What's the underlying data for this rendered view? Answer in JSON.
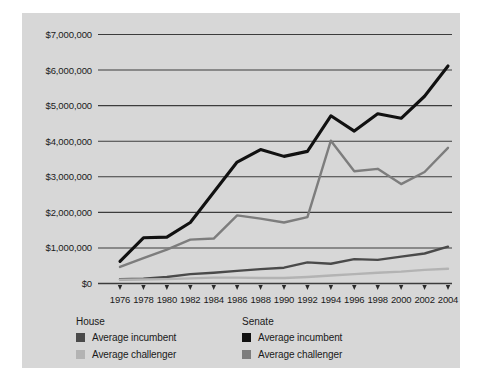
{
  "chart_data": {
    "type": "line",
    "title": "",
    "xlabel": "",
    "ylabel": "",
    "ylim": [
      0,
      7000000
    ],
    "xlim": [
      1976,
      2004
    ],
    "grid": true,
    "legend_position": "below",
    "y_ticks": [
      0,
      1000000,
      2000000,
      3000000,
      4000000,
      5000000,
      6000000,
      7000000
    ],
    "y_tick_labels": [
      "$0",
      "$1,000,000",
      "$2,000,000",
      "$3,000,000",
      "$4,000,000",
      "$5,000,000",
      "$6,000,000",
      "$7,000,000"
    ],
    "categories": [
      1976,
      1978,
      1980,
      1982,
      1984,
      1986,
      1988,
      1990,
      1992,
      1994,
      1996,
      1998,
      2000,
      2002,
      2004
    ],
    "x_tick_labels": [
      "1976",
      "1978",
      "1980",
      "1982",
      "1984",
      "1986",
      "1988",
      "1990",
      "1992",
      "1994",
      "1996",
      "1998",
      "2000",
      "2002",
      "2004"
    ],
    "series": [
      {
        "name": "Senate average incumbent",
        "group": "Senate",
        "role": "Average incumbent",
        "color": "#111111",
        "width": 3.1,
        "values": [
          610000,
          1270000,
          1290000,
          1700000,
          2550000,
          3400000,
          3750000,
          3560000,
          3700000,
          4700000,
          4270000,
          4760000,
          4630000,
          5250000,
          6100000
        ]
      },
      {
        "name": "Senate average challenger",
        "group": "Senate",
        "role": "Average challenger",
        "color": "#7d7d7d",
        "width": 2.4,
        "values": [
          450000,
          700000,
          940000,
          1220000,
          1250000,
          1900000,
          1810000,
          1700000,
          1850000,
          4000000,
          3140000,
          3210000,
          2780000,
          3120000,
          3800000
        ]
      },
      {
        "name": "House average incumbent",
        "group": "House",
        "role": "Average incumbent",
        "color": "#4a4a4a",
        "width": 2.4,
        "values": [
          105000,
          120000,
          170000,
          250000,
          290000,
          340000,
          390000,
          430000,
          580000,
          540000,
          670000,
          650000,
          740000,
          830000,
          1020000
        ]
      },
      {
        "name": "House average challenger",
        "group": "House",
        "role": "Average challenger",
        "color": "#b3b3b3",
        "width": 2.4,
        "values": [
          95000,
          100000,
          110000,
          130000,
          150000,
          150000,
          140000,
          140000,
          170000,
          210000,
          250000,
          290000,
          320000,
          370000,
          400000
        ]
      }
    ]
  },
  "legend": {
    "groups": [
      {
        "title": "House",
        "entries": [
          {
            "label": "Average incumbent",
            "color": "#4a4a4a"
          },
          {
            "label": "Average challenger",
            "color": "#b3b3b3"
          }
        ]
      },
      {
        "title": "Senate",
        "entries": [
          {
            "label": "Average incumbent",
            "color": "#111111"
          },
          {
            "label": "Average challenger",
            "color": "#7d7d7d"
          }
        ]
      }
    ]
  },
  "colors": {
    "panel": "#d7d7d7",
    "gridline": "#3c3c3c",
    "axis": "#3c3c3c",
    "text": "#1a1a1a"
  }
}
